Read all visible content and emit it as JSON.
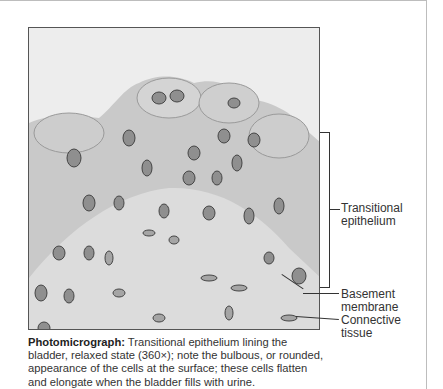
{
  "figure": {
    "labels": {
      "transitional_epithelium": "Transitional epithelium",
      "transitional_line1": "Transitional",
      "transitional_line2": "epithelium",
      "basement_line1": "Basement",
      "basement_line2": "membrane",
      "connective_line1": "Connective",
      "connective_line2": "tissue"
    },
    "caption": {
      "lead": "Photomicrograph:",
      "text": " Transitional epithelium lining the bladder, relaxed state (360×); note the bulbous, or rounded, appearance of the cells at the surface; these cells flatten and elongate when the bladder fills with urine."
    },
    "image_description": "Grayscale light micrograph of transitional epithelium with rounded surface cells and basement membrane over connective tissue"
  }
}
